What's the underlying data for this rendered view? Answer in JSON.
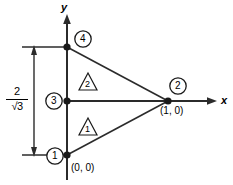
{
  "figure": {
    "type": "finite-element-mesh-diagram",
    "background_color": "#ffffff",
    "line_color": "#1a1a1a"
  },
  "axes": {
    "x_label": "x",
    "y_label": "y",
    "x_axis_name": "x-axis",
    "y_axis_name": "y-axis"
  },
  "nodes": [
    {
      "id": "1",
      "label": "1",
      "coord_label": "(0, 0)",
      "x": 0.0,
      "y": -1.1547
    },
    {
      "id": "2",
      "label": "2",
      "coord_label": "(1, 0)",
      "x": 1.0,
      "y": 0.0
    },
    {
      "id": "3",
      "label": "3",
      "coord_label": "",
      "x": 0.0,
      "y": 0.0
    },
    {
      "id": "4",
      "label": "4",
      "coord_label": "",
      "x": 0.0,
      "y": 1.1547
    }
  ],
  "elements": [
    {
      "id": "1",
      "label": "1",
      "nodes": [
        "1",
        "2",
        "3"
      ]
    },
    {
      "id": "2",
      "label": "2",
      "nodes": [
        "3",
        "2",
        "4"
      ]
    }
  ],
  "dimension": {
    "name": "height-dimension",
    "numerator": "2",
    "denominator": "√3",
    "value_text": "2/√3"
  }
}
